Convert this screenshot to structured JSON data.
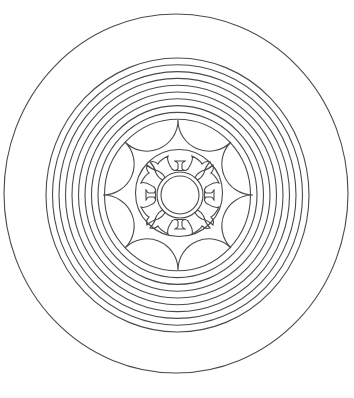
{
  "image": {
    "description": "Coloring-page line drawing: outer circle, ten concentric rings, eight-point concave star, lotus medallion with double center circle",
    "stroke_color": "#4a4a4a",
    "background_color": "#ffffff",
    "center": [
      178,
      195
    ],
    "outer_circle": {
      "rx": 172,
      "ry": 179.5,
      "cx": 176,
      "cy": 193.5
    },
    "ring_count": 10,
    "star_points": 8,
    "lotus_motifs": 4
  }
}
